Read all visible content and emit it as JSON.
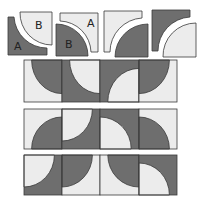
{
  "colors": {
    "dark": "#6e6e6e",
    "light": "#ececec",
    "stroke": "#3a3a3a",
    "background": "#ffffff"
  },
  "pieces": [
    {
      "id": 1,
      "labels": {
        "dark_L": "A",
        "light_quarter": "B"
      },
      "description": "dark L-shape A with light quarter-circle B, separated"
    },
    {
      "id": 2,
      "labels": {
        "light_L": "A",
        "dark_quarter": "B"
      },
      "description": "light L-shape A with dark quarter-circle B, separated"
    },
    {
      "id": 3,
      "labels": {},
      "description": "light L-shape with dark quarter-circle, separated"
    },
    {
      "id": 4,
      "labels": {},
      "description": "dark L-shape with light quarter-circle, separated"
    }
  ],
  "grid": {
    "rows": 3,
    "cols": 4,
    "cells": [
      [
        {
          "bg": "light",
          "arc": "top-right"
        },
        {
          "bg": "dark",
          "arc": "top-right"
        },
        {
          "bg": "dark",
          "arc": "bottom-right"
        },
        {
          "bg": "light",
          "arc": "top-left"
        }
      ],
      [
        {
          "bg": "light",
          "arc": "bottom-right"
        },
        {
          "bg": "dark",
          "arc": "top-left"
        },
        {
          "bg": "dark",
          "arc": "bottom-left"
        },
        {
          "bg": "light",
          "arc": "bottom-left"
        }
      ],
      [
        {
          "bg": "dark",
          "arc": "top-left"
        },
        {
          "bg": "light",
          "arc": "top-left"
        },
        {
          "bg": "light",
          "arc": "top-right"
        },
        {
          "bg": "dark",
          "arc": "bottom-left"
        }
      ]
    ]
  },
  "labels": {
    "p1_dark": "A",
    "p1_light": "B",
    "p2_light": "A",
    "p2_dark": "B"
  }
}
